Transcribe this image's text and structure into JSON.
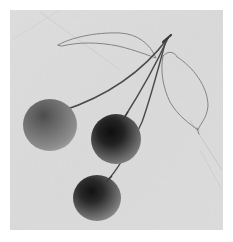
{
  "artwork": {
    "subject": "three cherries on stems with two outlined leaves",
    "style": "grayscale painting on textured paper",
    "colors": {
      "page_background": "#ffffff",
      "paper": "#d9d9d9",
      "paper_light": "#e3e3e3",
      "cherry_dark": "#1c1c1c",
      "cherry_mid": "#6a6a6a",
      "cherry_light": "#9a9a9a",
      "stem": "#4a4a4a",
      "leaf_outline": "#7a7a7a"
    },
    "paper_bounds": {
      "x": 10,
      "y": 10,
      "width": 213,
      "height": 220
    },
    "cherries": [
      {
        "name": "left-cherry",
        "cx": 50,
        "cy": 125,
        "r": 27,
        "core_cx": 42,
        "core_cy": 113,
        "tone": "light"
      },
      {
        "name": "middle-cherry",
        "cx": 116,
        "cy": 139,
        "r": 25,
        "core_cx": 110,
        "core_cy": 130,
        "tone": "dark"
      },
      {
        "name": "bottom-cherry",
        "cx": 97,
        "cy": 198,
        "r": 24,
        "core_cx": 92,
        "core_cy": 189,
        "tone": "dark"
      }
    ],
    "stem_top": {
      "x": 168,
      "y": 38
    },
    "leaves": [
      {
        "name": "upper-leaf"
      },
      {
        "name": "right-leaf"
      }
    ]
  }
}
